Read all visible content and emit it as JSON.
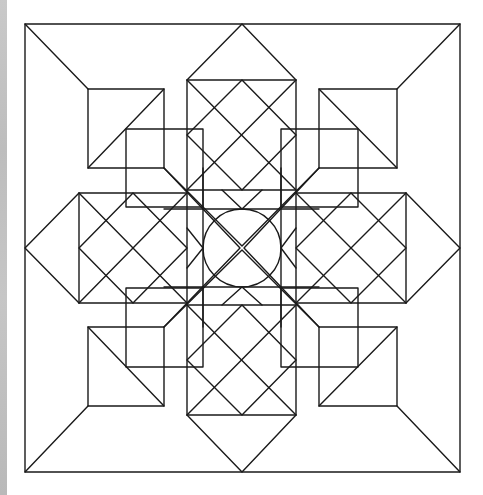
{
  "image": {
    "description": "Symmetric geometric line-art pattern of squares, diamonds and a central circle inside an outer square frame",
    "line_color": "#1a1a1a",
    "background_color": "#ffffff",
    "side_strip_color": "#c2c2c2"
  },
  "geometry": {
    "outer_square": [
      25,
      24,
      460,
      472
    ],
    "inner_frame": [
      88,
      89,
      397,
      406
    ],
    "center": [
      242,
      248
    ],
    "circle_radius": 39
  }
}
